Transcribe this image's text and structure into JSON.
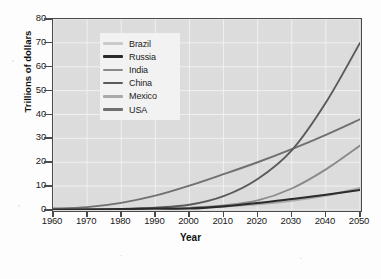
{
  "chart_data": {
    "type": "line",
    "title": "",
    "xlabel": "Year",
    "ylabel": "Trillions of dollars",
    "xlim": [
      1960,
      2050
    ],
    "ylim": [
      0,
      80
    ],
    "xticks": [
      1960,
      1970,
      1980,
      1990,
      2000,
      2010,
      2020,
      2030,
      2040,
      2050
    ],
    "yticks": [
      0,
      10,
      20,
      30,
      40,
      50,
      60,
      70,
      80
    ],
    "grid": true,
    "legend_position": "upper-left-inside",
    "x": [
      1960,
      1970,
      1980,
      1990,
      2000,
      2010,
      2020,
      2030,
      2040,
      2050
    ],
    "series": [
      {
        "name": "Brazil",
        "color": "#c9c9c9",
        "values": [
          0.1,
          0.2,
          0.4,
          0.7,
          0.9,
          1.6,
          2.8,
          4.3,
          6.2,
          8.7
        ]
      },
      {
        "name": "Russia",
        "color": "#2b2b2b",
        "values": [
          0.1,
          0.2,
          0.4,
          0.6,
          0.6,
          1.5,
          2.9,
          4.6,
          6.4,
          8.4
        ]
      },
      {
        "name": "India",
        "color": "#8a8a8a",
        "values": [
          0.1,
          0.2,
          0.3,
          0.5,
          0.9,
          1.9,
          4.0,
          9.0,
          17.0,
          27.0
        ]
      },
      {
        "name": "China",
        "color": "#5a5a5a",
        "values": [
          0.1,
          0.2,
          0.4,
          1.0,
          2.2,
          5.8,
          13.0,
          25.0,
          45.0,
          70.0
        ]
      },
      {
        "name": "Mexico",
        "color": "#aaaaaa",
        "values": [
          0.1,
          0.2,
          0.4,
          0.6,
          0.9,
          1.4,
          2.4,
          3.9,
          6.0,
          9.2
        ]
      },
      {
        "name": "USA",
        "color": "#707070",
        "values": [
          0.6,
          1.2,
          3.0,
          6.0,
          10.2,
          15.0,
          20.0,
          25.5,
          31.5,
          38.0
        ]
      }
    ]
  },
  "axes": {
    "y_title": "Trillions of dollars",
    "x_title": "Year",
    "y_tick_labels": [
      "0",
      "10",
      "20",
      "30",
      "40",
      "50",
      "60",
      "70",
      "80"
    ],
    "x_tick_labels": [
      "1960",
      "1970",
      "1980",
      "1990",
      "2000",
      "2010",
      "2020",
      "2030",
      "2040",
      "2050"
    ]
  },
  "legend": {
    "items": [
      {
        "label": "Brazil",
        "color": "#c9c9c9"
      },
      {
        "label": "Russia",
        "color": "#2b2b2b"
      },
      {
        "label": "India",
        "color": "#8a8a8a"
      },
      {
        "label": "China",
        "color": "#5a5a5a"
      },
      {
        "label": "Mexico",
        "color": "#aaaaaa"
      },
      {
        "label": "USA",
        "color": "#707070"
      }
    ]
  },
  "style": {
    "plot_background": "#dcdcdc",
    "grid_color": "#f0f0f0",
    "frame_color": "#4a4a4a",
    "page_background": "#fdfdfd"
  }
}
